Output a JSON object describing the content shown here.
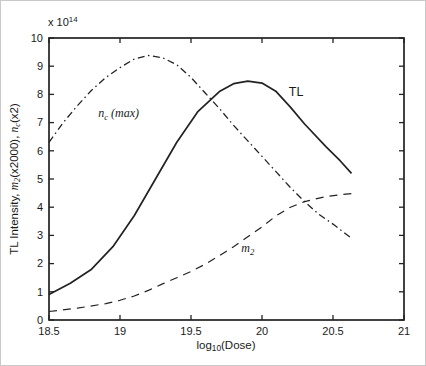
{
  "figure": {
    "background": "#ffffff",
    "line_color": "#222222",
    "tick_label_color": "#1a1a1a"
  },
  "labels": {
    "ylabel_parts": [
      {
        "t": "TL Intensity, "
      },
      {
        "t": "m",
        "style": "italic"
      },
      {
        "t": "2",
        "style": "sub-italic"
      },
      {
        "t": "(x2000), "
      },
      {
        "t": "n",
        "style": "italic"
      },
      {
        "t": "c",
        "style": "sub-italic"
      },
      {
        "t": "(x2)"
      }
    ],
    "xlabel_parts": [
      {
        "t": "log"
      },
      {
        "t": "10",
        "style": "sub"
      },
      {
        "t": "(Dose)"
      }
    ],
    "exponent_parts": [
      {
        "t": "x 10"
      },
      {
        "t": "14",
        "style": "sup"
      }
    ]
  },
  "annotations": [
    {
      "id": "nc-max",
      "x": 18.99,
      "y": 7.3,
      "font": "serif",
      "parts": [
        {
          "t": "n",
          "style": "italic"
        },
        {
          "t": "c",
          "style": "sub-italic"
        },
        {
          "t": " (max)",
          "style": "italic"
        }
      ]
    },
    {
      "id": "tl",
      "x": 20.24,
      "y": 8.1,
      "font": "sans",
      "parts": [
        {
          "t": "TL"
        }
      ]
    },
    {
      "id": "m2",
      "x": 19.9,
      "y": 2.52,
      "font": "serif",
      "parts": [
        {
          "t": "m",
          "style": "italic"
        },
        {
          "t": "2",
          "style": "sub-italic"
        }
      ]
    }
  ],
  "chart_data": {
    "type": "line",
    "title": "",
    "xlabel": "log10(Dose)",
    "ylabel": "TL Intensity, m2(x2000), nc(x2)",
    "y_scale_factor": "x 10^14",
    "xlim": [
      18.5,
      21
    ],
    "ylim": [
      0,
      10
    ],
    "grid": false,
    "legend_position": "none",
    "box": true,
    "xticks": [
      {
        "v": 18.5,
        "label": "18.5"
      },
      {
        "v": 19,
        "label": "19"
      },
      {
        "v": 19.5,
        "label": "19.5"
      },
      {
        "v": 20,
        "label": "20"
      },
      {
        "v": 20.5,
        "label": "20.5"
      },
      {
        "v": 21,
        "label": "21"
      }
    ],
    "yticks": [
      {
        "v": 0,
        "label": "0"
      },
      {
        "v": 1,
        "label": "1"
      },
      {
        "v": 2,
        "label": "2"
      },
      {
        "v": 3,
        "label": "3"
      },
      {
        "v": 4,
        "label": "4"
      },
      {
        "v": 5,
        "label": "5"
      },
      {
        "v": 6,
        "label": "6"
      },
      {
        "v": 7,
        "label": "7"
      },
      {
        "v": 8,
        "label": "8"
      },
      {
        "v": 9,
        "label": "9"
      },
      {
        "v": 10,
        "label": "10"
      }
    ],
    "series": [
      {
        "name": "TL",
        "style": "solid",
        "x": [
          18.5,
          18.65,
          18.8,
          18.95,
          19.1,
          19.25,
          19.4,
          19.55,
          19.7,
          19.8,
          19.9,
          20.0,
          20.1,
          20.2,
          20.3,
          20.45,
          20.55,
          20.63
        ],
        "y": [
          0.9,
          1.3,
          1.8,
          2.6,
          3.7,
          5.0,
          6.3,
          7.4,
          8.1,
          8.38,
          8.47,
          8.4,
          8.1,
          7.55,
          6.95,
          6.15,
          5.65,
          5.2
        ]
      },
      {
        "name": "nc(max)",
        "style": "dash-dot",
        "x": [
          18.5,
          18.6,
          18.7,
          18.8,
          18.9,
          19.0,
          19.1,
          19.2,
          19.3,
          19.4,
          19.5,
          19.6,
          19.7,
          19.8,
          19.9,
          20.0,
          20.1,
          20.2,
          20.3,
          20.4,
          20.5,
          20.63
        ],
        "y": [
          6.3,
          7.0,
          7.6,
          8.15,
          8.6,
          8.95,
          9.25,
          9.38,
          9.3,
          9.05,
          8.6,
          8.05,
          7.5,
          6.9,
          6.35,
          5.8,
          5.25,
          4.7,
          4.2,
          3.75,
          3.4,
          2.9
        ]
      },
      {
        "name": "m2",
        "style": "dashed",
        "x": [
          18.5,
          18.7,
          18.9,
          19.0,
          19.1,
          19.2,
          19.3,
          19.4,
          19.5,
          19.6,
          19.7,
          19.8,
          19.9,
          20.0,
          20.1,
          20.2,
          20.3,
          20.45,
          20.55,
          20.66
        ],
        "y": [
          0.3,
          0.42,
          0.58,
          0.7,
          0.85,
          1.05,
          1.28,
          1.5,
          1.72,
          1.98,
          2.28,
          2.6,
          2.95,
          3.3,
          3.7,
          4.0,
          4.2,
          4.38,
          4.44,
          4.5
        ]
      }
    ]
  }
}
